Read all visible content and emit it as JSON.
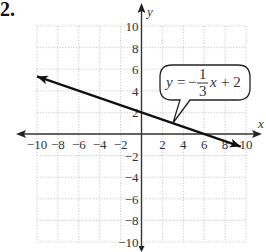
{
  "problem_number": "2.",
  "chart_data": {
    "type": "line",
    "title": "",
    "xlabel": "x",
    "ylabel": "y",
    "xlim": [
      -10,
      10
    ],
    "ylim": [
      -10,
      10
    ],
    "grid": true,
    "x_ticks": [
      "−10",
      "−8",
      "−6",
      "−4",
      "−2",
      "2",
      "4",
      "6",
      "8",
      "10"
    ],
    "y_ticks": [
      "10",
      "8",
      "6",
      "4",
      "2",
      "−2",
      "−4",
      "−6",
      "−8",
      "−10"
    ],
    "series": [
      {
        "name": "y = -1/3 x + 2",
        "slope": -0.3333,
        "intercept": 2,
        "x": [
          -10,
          -6,
          -3,
          0,
          3,
          6,
          9.5
        ],
        "y": [
          5.33,
          4,
          3,
          2,
          1,
          0,
          -1.17
        ],
        "arrows": "both"
      }
    ],
    "annotations": [
      {
        "type": "callout",
        "text": "y = −(1/3)x + 2",
        "lhs": "y",
        "equals": "=",
        "sign": "−",
        "numerator": "1",
        "denominator": "3",
        "var": "x",
        "rest": "+ 2",
        "points_to": [
          3,
          1
        ]
      }
    ]
  }
}
